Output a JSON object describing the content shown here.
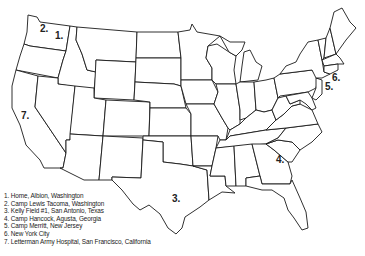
{
  "map": {
    "title": "United States locations map",
    "markers": [
      {
        "id": "1",
        "label": "1.",
        "x": 55,
        "y": 36
      },
      {
        "id": "2",
        "label": "2.",
        "x": 40,
        "y": 27
      },
      {
        "id": "3",
        "label": "3.",
        "x": 173,
        "y": 196
      },
      {
        "id": "4",
        "label": "4.",
        "x": 277,
        "y": 155
      },
      {
        "id": "5",
        "label": "5.",
        "x": 325,
        "y": 88
      },
      {
        "id": "6",
        "label": "6.",
        "x": 332,
        "y": 75
      },
      {
        "id": "7",
        "label": "7.",
        "x": 22,
        "y": 113
      }
    ]
  },
  "legend": {
    "items": [
      "1. Home,  Albion, Washington",
      "2. Camp Lewis Tacoma, Washington",
      "3. Kelly Field #1, San Antonio, Texas",
      "4. Camp Hancock,  Agusta, Georgia",
      "5. Camp Merritt, New Jersey",
      "6. New York City",
      "7. Letterman Army Hospital, San Francisco, California"
    ]
  }
}
